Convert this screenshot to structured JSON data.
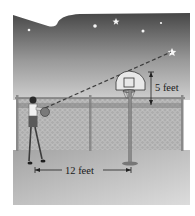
{
  "figure": {
    "labels": {
      "vertical_measure": "5 feet",
      "horizontal_measure": "12 feet"
    },
    "colors": {
      "sky_top": "#4a4a4a",
      "sky_bottom": "#c9c9c9",
      "ground_top": "#9a9a9a",
      "ground_bottom": "#d8d8d8",
      "fence": "#8c8c8c",
      "star": "#f4f4f4",
      "dashed_line": "#444444"
    },
    "stars": [
      {
        "x": 29,
        "y": 30
      },
      {
        "x": 95,
        "y": 26
      },
      {
        "x": 116,
        "y": 21
      },
      {
        "x": 143,
        "y": 31
      },
      {
        "x": 161,
        "y": 23
      },
      {
        "x": 172,
        "y": 52
      }
    ]
  }
}
